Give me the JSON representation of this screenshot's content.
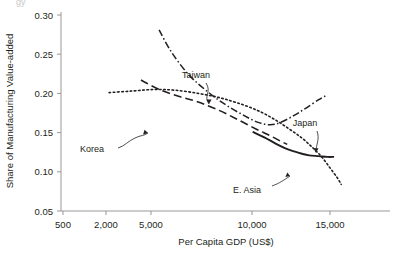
{
  "chart_data": {
    "type": "line",
    "title": "",
    "xlabel": "Per Capita GDP (US$)",
    "ylabel": "Share of Manufacturing Value-added",
    "xscale": "log",
    "xlim": [
      500,
      17500
    ],
    "ylim": [
      0.05,
      0.3
    ],
    "xticks": [
      500,
      2000,
      5000,
      10000,
      15000
    ],
    "xticklabels": [
      "500",
      "2,000",
      "5,000",
      "10,000",
      "15,000"
    ],
    "yticks": [
      0.05,
      0.1,
      0.15,
      0.2,
      0.25,
      0.3
    ],
    "yticklabels": [
      "0.05",
      "0.10",
      "0.15",
      "0.20",
      "0.25",
      "0.30"
    ],
    "grid": false,
    "legend": "inline-annotations",
    "clipped_top_text": "gy",
    "series": [
      {
        "name": "Taiwan",
        "style": "dash-dot",
        "label_text": "Taiwan",
        "points": [
          [
            1700,
            0.281
          ],
          [
            2000,
            0.252
          ],
          [
            2500,
            0.223
          ],
          [
            3200,
            0.201
          ],
          [
            4000,
            0.185
          ],
          [
            5000,
            0.172
          ],
          [
            6000,
            0.163
          ],
          [
            7000,
            0.16
          ],
          [
            8000,
            0.163
          ],
          [
            9500,
            0.172
          ],
          [
            11000,
            0.181
          ],
          [
            13000,
            0.192
          ],
          [
            14200,
            0.197
          ]
        ]
      },
      {
        "name": "Korea",
        "style": "dashed",
        "label_text": "Korea",
        "points": [
          [
            1350,
            0.217
          ],
          [
            1700,
            0.205
          ],
          [
            2200,
            0.196
          ],
          [
            2800,
            0.189
          ],
          [
            3600,
            0.179
          ],
          [
            4600,
            0.167
          ],
          [
            5800,
            0.155
          ],
          [
            7000,
            0.146
          ],
          [
            8000,
            0.139
          ],
          [
            8700,
            0.135
          ]
        ]
      },
      {
        "name": "E. Asia",
        "style": "dotted",
        "label_text": "E. Asia",
        "points": [
          [
            900,
            0.201
          ],
          [
            1200,
            0.203
          ],
          [
            1600,
            0.205
          ],
          [
            2100,
            0.204
          ],
          [
            2800,
            0.2
          ],
          [
            3600,
            0.195
          ],
          [
            4600,
            0.188
          ],
          [
            6000,
            0.178
          ],
          [
            7500,
            0.166
          ],
          [
            9000,
            0.154
          ],
          [
            10500,
            0.143
          ],
          [
            12000,
            0.131
          ],
          [
            13500,
            0.119
          ],
          [
            15000,
            0.105
          ],
          [
            16500,
            0.092
          ],
          [
            17300,
            0.084
          ]
        ]
      },
      {
        "name": "Japan",
        "style": "solid",
        "label_text": "Japan",
        "points": [
          [
            5600,
            0.151
          ],
          [
            6500,
            0.144
          ],
          [
            7500,
            0.136
          ],
          [
            8500,
            0.13
          ],
          [
            9500,
            0.126
          ],
          [
            10500,
            0.123
          ],
          [
            11500,
            0.121
          ],
          [
            13000,
            0.12
          ],
          [
            14500,
            0.119
          ],
          [
            15800,
            0.119
          ]
        ]
      }
    ],
    "annotations": [
      {
        "text": "Taiwan",
        "label_x": 196,
        "label_y": 78
      },
      {
        "text": "Korea",
        "label_x": 92,
        "label_y": 152
      },
      {
        "text": "E. Asia",
        "label_x": 247,
        "label_y": 193
      },
      {
        "text": "Japan",
        "label_x": 305,
        "label_y": 126
      }
    ],
    "colors": {
      "line": "#231f20",
      "axis": "#8e8d8d",
      "text": "#231f20",
      "background": "#ffffff"
    }
  }
}
